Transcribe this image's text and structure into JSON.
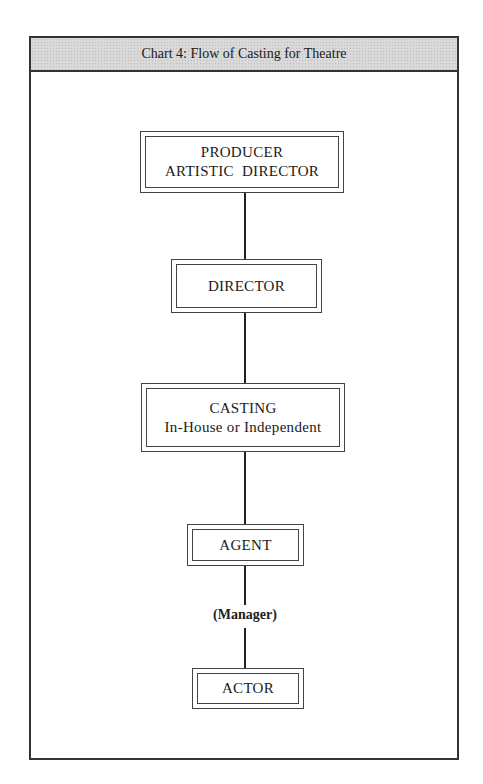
{
  "page": {
    "top_cutoff_text": "THE CASTING DIRECTOR"
  },
  "chart": {
    "title": "Chart 4: Flow of Casting for Theatre"
  },
  "nodes": [
    {
      "id": "producer",
      "line1": "PRODUCER",
      "line2": "ARTISTIC  DIRECTOR"
    },
    {
      "id": "director",
      "line1": "DIRECTOR",
      "line2": ""
    },
    {
      "id": "casting",
      "line1": "CASTING",
      "line2": "In-House or Independent"
    },
    {
      "id": "agent",
      "line1": "AGENT",
      "line2": ""
    },
    {
      "id": "actor",
      "line1": "ACTOR",
      "line2": ""
    }
  ],
  "intermediate_label": "(Manager)",
  "colors": {
    "header_bg": "#d9d9d9",
    "border": "#333333"
  }
}
